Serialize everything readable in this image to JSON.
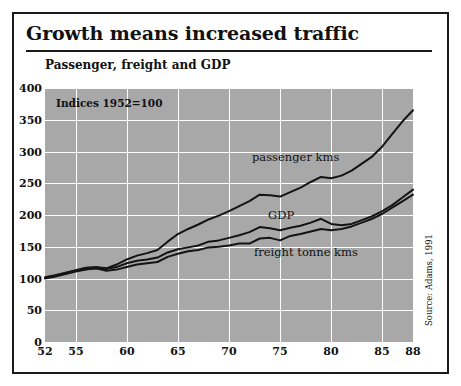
{
  "figure": {
    "title": "Growth means increased traffic",
    "subtitle": "Passenger, freight and GDP",
    "note": "Indices 1952=100",
    "source": "Source: Adams, 1991",
    "background": "#ffffff",
    "plot_background": "#a8a8a8",
    "line_color": "#141414",
    "grid_color": "#ffffff"
  },
  "chart_data": {
    "type": "line",
    "title": "Growth means increased traffic",
    "subtitle": "Passenger, freight and GDP",
    "annotation": "Indices 1952=100",
    "source": "Source: Adams, 1991",
    "xlabel": "",
    "ylabel": "",
    "xlim": [
      52,
      88
    ],
    "ylim": [
      0,
      400
    ],
    "yticks": [
      0,
      50,
      100,
      150,
      200,
      250,
      300,
      350,
      400
    ],
    "ytick_labels": [
      "0",
      "50",
      "100",
      "150",
      "200",
      "250",
      "300",
      "350",
      "400"
    ],
    "xticks": [
      52,
      55,
      60,
      65,
      70,
      75,
      80,
      85,
      88
    ],
    "xtick_labels": [
      "52",
      "55",
      "60",
      "65",
      "70",
      "75",
      "80",
      "85",
      "88"
    ],
    "grid": true,
    "grid_axes": "both",
    "legend": "inline-labels",
    "x": [
      52,
      53,
      54,
      55,
      56,
      57,
      58,
      59,
      60,
      61,
      62,
      63,
      64,
      65,
      66,
      67,
      68,
      69,
      70,
      71,
      72,
      73,
      74,
      75,
      76,
      77,
      78,
      79,
      80,
      81,
      82,
      83,
      84,
      85,
      86,
      87,
      88
    ],
    "series": [
      {
        "name": "passenger kms",
        "label": "passenger kms",
        "values": [
          102,
          105,
          109,
          113,
          117,
          118,
          116,
          122,
          130,
          136,
          140,
          145,
          158,
          170,
          178,
          185,
          193,
          199,
          206,
          214,
          222,
          232,
          231,
          229,
          236,
          243,
          252,
          260,
          258,
          262,
          270,
          281,
          292,
          308,
          328,
          348,
          365
        ]
      },
      {
        "name": "GDP",
        "label": "GDP",
        "values": [
          101,
          104,
          108,
          112,
          115,
          116,
          115,
          118,
          124,
          128,
          130,
          133,
          141,
          146,
          149,
          152,
          158,
          160,
          164,
          168,
          173,
          181,
          179,
          176,
          180,
          183,
          188,
          194,
          186,
          184,
          186,
          192,
          198,
          206,
          216,
          228,
          240
        ]
      },
      {
        "name": "freight tonne kms",
        "label": "freight tonne kms",
        "values": [
          100,
          103,
          107,
          111,
          114,
          116,
          112,
          114,
          118,
          122,
          124,
          126,
          134,
          139,
          143,
          145,
          149,
          150,
          152,
          155,
          155,
          163,
          164,
          160,
          167,
          170,
          174,
          178,
          176,
          178,
          182,
          188,
          194,
          202,
          212,
          222,
          232
        ]
      }
    ]
  }
}
